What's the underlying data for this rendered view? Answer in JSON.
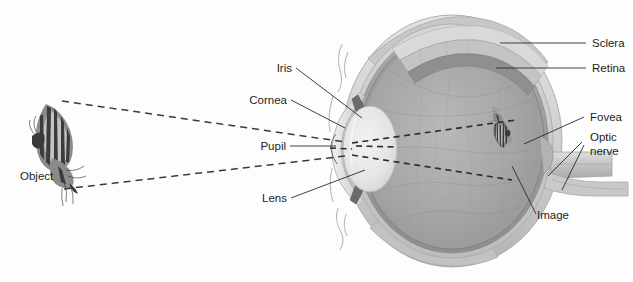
{
  "figure": {
    "background_color": "#fdfdfd",
    "width": 633,
    "height": 282
  },
  "labels": {
    "object": "Object",
    "iris": "Iris",
    "cornea": "Cornea",
    "pupil": "Pupil",
    "lens": "Lens",
    "sclera": "Sclera",
    "retina": "Retina",
    "fovea": "Fovea",
    "optic_nerve_line1": "Optic",
    "optic_nerve_line2": "nerve",
    "image": "Image"
  },
  "parts": [
    {
      "id": "object",
      "label": "Object",
      "side": "left",
      "x": 20,
      "y": 176
    },
    {
      "id": "iris",
      "label": "Iris",
      "side": "left",
      "x": 274,
      "y": 71
    },
    {
      "id": "cornea",
      "label": "Cornea",
      "side": "left",
      "x": 251,
      "y": 103
    },
    {
      "id": "pupil",
      "label": "Pupil",
      "side": "left",
      "x": 262,
      "y": 149
    },
    {
      "id": "lens",
      "label": "Lens",
      "side": "left",
      "x": 261,
      "y": 201
    },
    {
      "id": "sclera",
      "label": "Sclera",
      "side": "right",
      "x": 596,
      "y": 47
    },
    {
      "id": "retina",
      "label": "Retina",
      "side": "right",
      "x": 596,
      "y": 72
    },
    {
      "id": "fovea",
      "label": "Fovea",
      "side": "right",
      "x": 592,
      "y": 121
    },
    {
      "id": "optic-nerve",
      "label": "Optic nerve",
      "side": "right",
      "x": 590,
      "y": 141
    },
    {
      "id": "image",
      "label": "Image",
      "side": "right",
      "x": 539,
      "y": 219
    }
  ],
  "colors": {
    "background": "#fdfdfd",
    "sclera_outer": "#cfcfcf",
    "sclera_shade": "#b5b5b5",
    "choroid": "#9b9b9b",
    "retina_band": "#8a8a8a",
    "vitreous": "#a8a8a8",
    "vitreous_light": "#bcbcbc",
    "lens_fill": "#e8e8e8",
    "cornea_fill": "#dcdcdc",
    "iris_dark": "#6f6f6f",
    "optic_nerve": "#c4c4c4",
    "label_text": "#1d1d1d",
    "leader_line": "#2a2a2a",
    "ray_line": "#3a3a3a"
  },
  "optics": {
    "ray_style": "dashed",
    "description": "Light rays from the object converge through the pupil and lens, cross, and form an inverted image on the retina at the fovea.",
    "object_top_y": 101,
    "object_bottom_y": 189,
    "pupil_x": 347,
    "pupil_y": 149,
    "image_x": 512,
    "image_y": 150
  }
}
